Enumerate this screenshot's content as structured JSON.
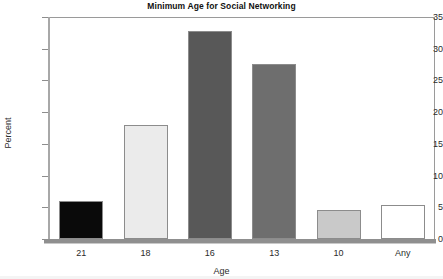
{
  "chart_data": {
    "type": "bar",
    "title": "Minimum Age for Social Networking",
    "xlabel": "Age",
    "ylabel": "Percent",
    "categories": [
      "21",
      "18",
      "16",
      "13",
      "10",
      "Any"
    ],
    "values": [
      6.0,
      18.0,
      32.8,
      27.6,
      4.6,
      5.4
    ],
    "series": [
      {
        "name": "Percent",
        "values": [
          6.0,
          18.0,
          32.8,
          27.6,
          4.6,
          5.4
        ]
      }
    ],
    "bar_colors": [
      "#0a0a0a",
      "#ebebeb",
      "#585858",
      "#6e6e6e",
      "#c9c9c9",
      "#ffffff"
    ],
    "bar_border_color": "#8c8c8c",
    "ylim": [
      0,
      35
    ],
    "yticks": [
      0,
      5,
      10,
      15,
      20,
      25,
      30,
      35
    ],
    "ytick_labels": [
      "0",
      "5",
      "10",
      "15",
      "20",
      "25",
      "30",
      "35"
    ],
    "grid": false,
    "legend": "none"
  }
}
